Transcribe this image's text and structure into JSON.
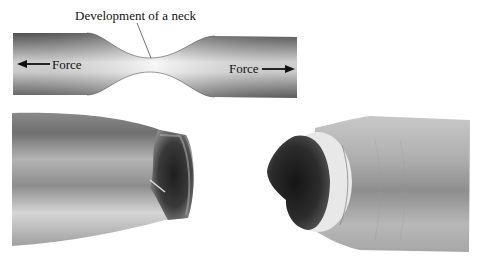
{
  "diagram": {
    "neck_label": "Development of a neck",
    "left_force_label": "Force",
    "right_force_label": "Force",
    "left_arrow_direction": "left",
    "right_arrow_direction": "right"
  },
  "photos": {
    "left": {
      "subject": "fractured specimen half (cup side)"
    },
    "right": {
      "subject": "fractured specimen half (cone side)"
    }
  },
  "colors": {
    "specimen_dark": "#6e6e6e",
    "specimen_light": "#f2f2f2",
    "fracture_dark": "#2a2a2a",
    "metal_mid": "#9a9a9a"
  }
}
